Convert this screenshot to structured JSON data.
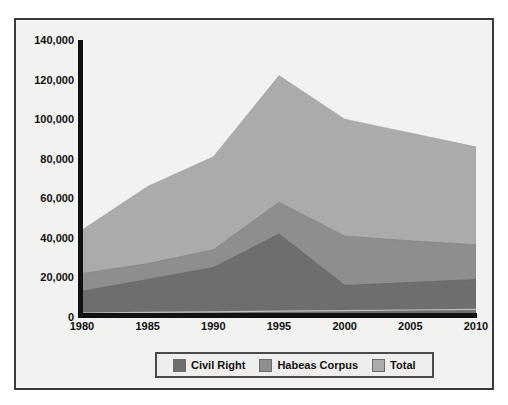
{
  "chart_data": {
    "type": "area",
    "stacked": true,
    "title": "",
    "subtitle": "",
    "xlabel": "",
    "ylabel": "",
    "categories": [
      "1980",
      "1985",
      "1990",
      "1995",
      "2000",
      "2005",
      "2010"
    ],
    "x": [
      1980,
      1985,
      1990,
      1995,
      2000,
      2005,
      2010
    ],
    "xlim": [
      1980,
      2010
    ],
    "ylim": [
      0,
      140000
    ],
    "ytick_labels": [
      "140,000",
      "120,000",
      "100,000",
      "80,000",
      "60,000",
      "40,000",
      "20,000",
      "0"
    ],
    "ytick_values": [
      140000,
      120000,
      100000,
      80000,
      60000,
      40000,
      20000,
      0
    ],
    "grid": false,
    "legend_position": "bottom",
    "series": [
      {
        "name": "Civil Right",
        "color": "#6e6e6e",
        "values": [
          13000,
          19000,
          25000,
          42000,
          16000,
          17500,
          19000
        ]
      },
      {
        "name": "Habeas Corpus",
        "color": "#8e8e8e",
        "values": [
          9000,
          8000,
          9000,
          16000,
          25000,
          21000,
          17500
        ]
      },
      {
        "name": "Total",
        "color": "#ababab",
        "values": [
          22000,
          39000,
          47000,
          64000,
          59000,
          54500,
          49500
        ]
      }
    ],
    "cumulative_tops": {
      "civil_right": [
        13000,
        19000,
        25000,
        42000,
        16000,
        17500,
        19000
      ],
      "habeas_corpus": [
        22000,
        27000,
        34000,
        58000,
        41000,
        38500,
        36500
      ],
      "total": [
        44000,
        66000,
        81000,
        122000,
        100000,
        93000,
        86000
      ]
    }
  },
  "legend": {
    "items": [
      {
        "label": "Civil Right",
        "color": "#6e6e6e"
      },
      {
        "label": "Habeas Corpus",
        "color": "#8e8e8e"
      },
      {
        "label": "Total",
        "color": "#ababab"
      }
    ]
  },
  "axes": {
    "y_ticks": [
      "140,000",
      "120,000",
      "100,000",
      "80,000",
      "60,000",
      "40,000",
      "20,000",
      "0"
    ],
    "x_ticks": [
      "1980",
      "1985",
      "1990",
      "1995",
      "2000",
      "2005",
      "2010"
    ]
  },
  "colors": {
    "background": "#f2f2f0",
    "frame": "#3a3a3a",
    "axis": "#111111",
    "civil_right": "#6e6e6e",
    "habeas_corpus": "#8e8e8e",
    "total": "#ababab"
  }
}
